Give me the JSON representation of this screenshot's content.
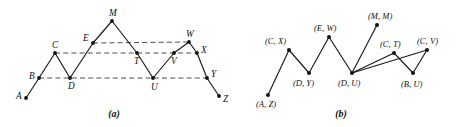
{
  "figure": {
    "width": 457,
    "height": 127,
    "background": "#ffffff",
    "ink_color": "#111111",
    "guide_color": "#3a3a3a"
  },
  "panel_a": {
    "caption": "(a)",
    "caption_pos": {
      "x": 114,
      "y": 117
    },
    "vertices": [
      {
        "id": "A",
        "label": "A",
        "x": 26,
        "y": 98,
        "label_dx": -10,
        "label_dy": 1
      },
      {
        "id": "B",
        "label": "B",
        "x": 39,
        "y": 78,
        "label_dx": -10,
        "label_dy": 1
      },
      {
        "id": "C",
        "label": "C",
        "x": 55,
        "y": 53,
        "label_dx": -3,
        "label_dy": -5
      },
      {
        "id": "D",
        "label": "D",
        "x": 70,
        "y": 78,
        "label_dx": -2,
        "label_dy": 11
      },
      {
        "id": "E",
        "label": "E",
        "x": 93,
        "y": 43,
        "label_dx": -10,
        "label_dy": -2
      },
      {
        "id": "M",
        "label": "M",
        "x": 112,
        "y": 21,
        "label_dx": -3,
        "label_dy": -5
      },
      {
        "id": "T",
        "label": "T",
        "x": 137,
        "y": 53,
        "label_dx": -3,
        "label_dy": 11
      },
      {
        "id": "U",
        "label": "U",
        "x": 153,
        "y": 78,
        "label_dx": -2,
        "label_dy": 12
      },
      {
        "id": "V",
        "label": "V",
        "x": 174,
        "y": 53,
        "label_dx": -3,
        "label_dy": 11
      },
      {
        "id": "W",
        "label": "W",
        "x": 189,
        "y": 42,
        "label_dx": -3,
        "label_dy": -5
      },
      {
        "id": "X",
        "label": "X",
        "x": 197,
        "y": 53,
        "label_dx": 4,
        "label_dy": 0
      },
      {
        "id": "Y",
        "label": "Y",
        "x": 207,
        "y": 78,
        "label_dx": 4,
        "label_dy": -1
      },
      {
        "id": "Z",
        "label": "Z",
        "x": 219,
        "y": 96,
        "label_dx": 4,
        "label_dy": 6
      }
    ],
    "path": [
      "A",
      "B",
      "C",
      "D",
      "E",
      "M",
      "T",
      "U",
      "V",
      "W",
      "X",
      "Y",
      "Z"
    ],
    "guide_lines": [
      {
        "name": "level-E-W",
        "x1": 93,
        "y1": 43,
        "x2": 189,
        "y2": 42
      },
      {
        "name": "level-C-T-V-X",
        "x1": 55,
        "y1": 53,
        "x2": 197,
        "y2": 53
      },
      {
        "name": "level-B-D-U-Y",
        "x1": 39,
        "y1": 78,
        "x2": 207,
        "y2": 78
      }
    ]
  },
  "panel_b": {
    "caption": "(b)",
    "caption_pos": {
      "x": 341,
      "y": 117
    },
    "vertices": [
      {
        "id": "AZ",
        "label": "(A, Z)",
        "x": 268,
        "y": 95,
        "label_dx": -12,
        "label_dy": 12
      },
      {
        "id": "CX",
        "label": "(C, X)",
        "x": 289,
        "y": 50,
        "label_dx": -24,
        "label_dy": -6
      },
      {
        "id": "DY",
        "label": "(D, Y)",
        "x": 309,
        "y": 73,
        "label_dx": -16,
        "label_dy": 13
      },
      {
        "id": "EW",
        "label": "(E, W)",
        "x": 329,
        "y": 37,
        "label_dx": -15,
        "label_dy": -6
      },
      {
        "id": "DU",
        "label": "(D, U)",
        "x": 352,
        "y": 73,
        "label_dx": -14,
        "label_dy": 13
      },
      {
        "id": "MM",
        "label": "(M, M)",
        "x": 377,
        "y": 25,
        "label_dx": -9,
        "label_dy": -6
      },
      {
        "id": "CT",
        "label": "(C, T)",
        "x": 394,
        "y": 53,
        "label_dx": -14,
        "label_dy": -6
      },
      {
        "id": "BU",
        "label": "(B, U)",
        "x": 413,
        "y": 73,
        "label_dx": -12,
        "label_dy": 14
      },
      {
        "id": "CV",
        "label": "(C, V)",
        "x": 427,
        "y": 50,
        "label_dx": -10,
        "label_dy": -6
      }
    ],
    "edges": [
      {
        "from": "AZ",
        "to": "CX"
      },
      {
        "from": "CX",
        "to": "DY"
      },
      {
        "from": "DY",
        "to": "EW"
      },
      {
        "from": "EW",
        "to": "DU"
      },
      {
        "from": "DU",
        "to": "MM"
      },
      {
        "from": "DU",
        "to": "CT"
      },
      {
        "from": "DU",
        "to": "CV"
      },
      {
        "from": "CT",
        "to": "BU"
      },
      {
        "from": "BU",
        "to": "CV"
      }
    ]
  }
}
